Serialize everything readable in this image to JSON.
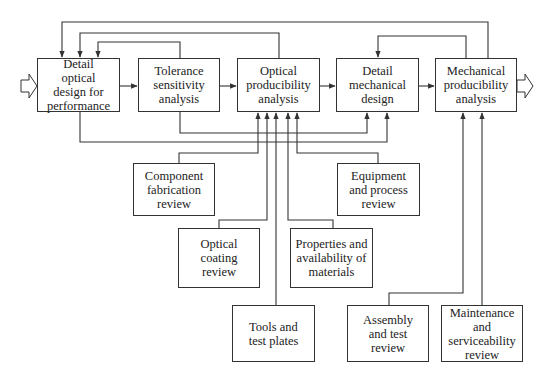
{
  "diagram": {
    "main_flow": [
      {
        "id": "detail-optical",
        "label": "Detail\noptical\ndesign for\nperformance"
      },
      {
        "id": "tolerance",
        "label": "Tolerance\nsensitivity\nanalysis"
      },
      {
        "id": "optical-producibility",
        "label": "Optical\nproducibility\nanalysis"
      },
      {
        "id": "detail-mechanical",
        "label": "Detail\nmechanical\ndesign"
      },
      {
        "id": "mechanical-producibility",
        "label": "Mechanical\nproducibility\nanalysis"
      }
    ],
    "inputs": [
      {
        "id": "component-fabrication",
        "label": "Component\nfabrication\nreview",
        "feeds": "optical-producibility"
      },
      {
        "id": "optical-coating",
        "label": "Optical\ncoating\nreview",
        "feeds": "optical-producibility"
      },
      {
        "id": "tools-test-plates",
        "label": "Tools and\ntest plates",
        "feeds": "optical-producibility"
      },
      {
        "id": "properties-materials",
        "label": "Properties and\navailability of\nmaterials",
        "feeds": "optical-producibility"
      },
      {
        "id": "equipment-process",
        "label": "Equipment\nand process\nreview",
        "feeds": "optical-producibility"
      },
      {
        "id": "assembly-test",
        "label": "Assembly\nand test\nreview",
        "feeds": "mechanical-producibility"
      },
      {
        "id": "maintenance",
        "label": "Maintenance\nand\nserviceability\nreview",
        "feeds": "mechanical-producibility"
      }
    ],
    "feedback": [
      {
        "from": "mechanical-producibility",
        "to": "detail-optical"
      },
      {
        "from": "optical-producibility",
        "to": "detail-optical"
      },
      {
        "from": "tolerance",
        "to": "detail-optical"
      },
      {
        "from": "mechanical-producibility",
        "to": "detail-mechanical"
      },
      {
        "from": "tolerance",
        "to": "detail-mechanical"
      },
      {
        "from": "detail-optical",
        "to": "detail-mechanical"
      }
    ]
  }
}
